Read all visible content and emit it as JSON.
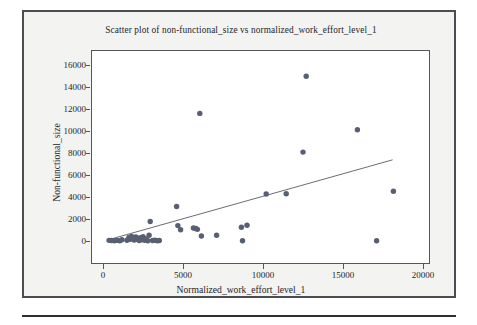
{
  "figure": {
    "background_color": "#f3f3f1",
    "border_color": "#4c4c52",
    "plot_background_color": "#ffffff",
    "axis_color": "#55555c",
    "rule_color": "#2e2e33"
  },
  "chart_data": {
    "type": "scatter",
    "title": "Scatter plot of non-functional_size vs normalized_work_effort_level_1",
    "xlabel": "Normalized_work_effort_level_1",
    "ylabel": "Non-functional_size",
    "xlim": [
      0,
      20000
    ],
    "ylim": [
      0,
      16000
    ],
    "xticks": [
      0,
      5000,
      10000,
      15000,
      20000
    ],
    "xtick_labels": [
      "0",
      "5000",
      "10000",
      "15000",
      "20000"
    ],
    "yticks": [
      0,
      2000,
      4000,
      6000,
      8000,
      10000,
      12000,
      14000,
      16000
    ],
    "ytick_labels": [
      "0",
      "2000",
      "4000",
      "6000",
      "8000",
      "10000",
      "12000",
      "14000",
      "16000"
    ],
    "grid": false,
    "legend": null,
    "marker_color": "#595f73",
    "marker_size": 4.2,
    "trendline": {
      "visible": true,
      "color": "#5a5a66",
      "x_start": 500,
      "y_start": 180,
      "x_end": 18100,
      "y_end": 7380
    },
    "points": [
      {
        "x": 380,
        "y": 60
      },
      {
        "x": 520,
        "y": 40
      },
      {
        "x": 700,
        "y": 30
      },
      {
        "x": 880,
        "y": 55
      },
      {
        "x": 1050,
        "y": 20
      },
      {
        "x": 1180,
        "y": 120
      },
      {
        "x": 1500,
        "y": 70
      },
      {
        "x": 1620,
        "y": 330
      },
      {
        "x": 1700,
        "y": 150
      },
      {
        "x": 1790,
        "y": 420
      },
      {
        "x": 1850,
        "y": 250
      },
      {
        "x": 1950,
        "y": 90
      },
      {
        "x": 2050,
        "y": 360
      },
      {
        "x": 2120,
        "y": 160
      },
      {
        "x": 2200,
        "y": 230
      },
      {
        "x": 2260,
        "y": 50
      },
      {
        "x": 2340,
        "y": 310
      },
      {
        "x": 2420,
        "y": 120
      },
      {
        "x": 2500,
        "y": 400
      },
      {
        "x": 2600,
        "y": 60
      },
      {
        "x": 2680,
        "y": 180
      },
      {
        "x": 2800,
        "y": 30
      },
      {
        "x": 2880,
        "y": 520
      },
      {
        "x": 2950,
        "y": 1780
      },
      {
        "x": 3100,
        "y": 40
      },
      {
        "x": 3250,
        "y": 70
      },
      {
        "x": 3400,
        "y": 30
      },
      {
        "x": 3520,
        "y": 50
      },
      {
        "x": 4600,
        "y": 3140
      },
      {
        "x": 4680,
        "y": 1400
      },
      {
        "x": 4850,
        "y": 1020
      },
      {
        "x": 5650,
        "y": 1180
      },
      {
        "x": 5800,
        "y": 1140
      },
      {
        "x": 5900,
        "y": 1060
      },
      {
        "x": 6050,
        "y": 11600
      },
      {
        "x": 6150,
        "y": 460
      },
      {
        "x": 7100,
        "y": 520
      },
      {
        "x": 8650,
        "y": 1250
      },
      {
        "x": 8720,
        "y": 20
      },
      {
        "x": 9000,
        "y": 1430
      },
      {
        "x": 10200,
        "y": 4280
      },
      {
        "x": 11450,
        "y": 4300
      },
      {
        "x": 12500,
        "y": 8080
      },
      {
        "x": 12700,
        "y": 14980
      },
      {
        "x": 15900,
        "y": 10120
      },
      {
        "x": 17100,
        "y": 20
      },
      {
        "x": 18150,
        "y": 4520
      }
    ]
  }
}
